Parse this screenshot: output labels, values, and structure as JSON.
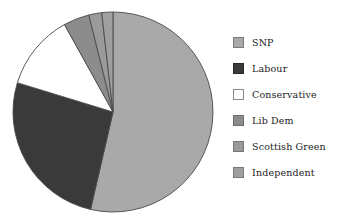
{
  "chart_data": {
    "type": "pie",
    "title": "",
    "subtitle": "",
    "xlabel": "",
    "ylabel": "",
    "grid": false,
    "legend_position": "right",
    "start_angle_deg": 0,
    "direction": "clockwise",
    "categories": [
      "SNP",
      "Labour",
      "Conservative",
      "Lib Dem",
      "Scottish Green",
      "Independent"
    ],
    "values": [
      53.6,
      26.1,
      12.2,
      4.2,
      2.1,
      1.8
    ],
    "value_unit": "percent",
    "colors": [
      "#a9a9a9",
      "#3a3a3a",
      "#ffffff",
      "#8c8c8c",
      "#9a9a9a",
      "#9f9f9f"
    ],
    "slices": [
      {
        "label": "SNP",
        "value": 53.6,
        "color": "#a9a9a9",
        "start_deg": 0.0,
        "end_deg": 193.0
      },
      {
        "label": "Labour",
        "value": 26.1,
        "color": "#3a3a3a",
        "start_deg": 193.0,
        "end_deg": 287.0
      },
      {
        "label": "Conservative",
        "value": 12.2,
        "color": "#ffffff",
        "start_deg": 287.0,
        "end_deg": 331.0
      },
      {
        "label": "Lib Dem",
        "value": 4.2,
        "color": "#8c8c8c",
        "start_deg": 331.0,
        "end_deg": 346.0
      },
      {
        "label": "Scottish Green",
        "value": 2.1,
        "color": "#9a9a9a",
        "start_deg": 346.0,
        "end_deg": 353.5
      },
      {
        "label": "Independent",
        "value": 1.8,
        "color": "#9f9f9f",
        "start_deg": 353.5,
        "end_deg": 360.0
      }
    ]
  },
  "legend": {
    "items": [
      {
        "label": "SNP",
        "color": "#a9a9a9",
        "border": "#7a7a7a"
      },
      {
        "label": "Labour",
        "color": "#3a3a3a",
        "border": "#2a2a2a"
      },
      {
        "label": "Conservative",
        "color": "#ffffff",
        "border": "#8a8a8a"
      },
      {
        "label": "Lib Dem",
        "color": "#8c8c8c",
        "border": "#6e6e6e"
      },
      {
        "label": "Scottish Green",
        "color": "#9a9a9a",
        "border": "#767676"
      },
      {
        "label": "Independent",
        "color": "#9f9f9f",
        "border": "#7a7a7a"
      }
    ]
  },
  "pie": {
    "center_x": 103,
    "center_y": 106,
    "radius": 100,
    "outline_color": "#4a4a4a"
  }
}
